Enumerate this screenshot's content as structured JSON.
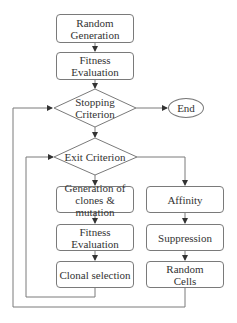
{
  "diagram": {
    "type": "flowchart",
    "nodes": {
      "random_generation": "Random Generation",
      "fitness_evaluation_1": "Fitness Evaluation",
      "stopping_criterion": "Stopping Criterion",
      "end": "End",
      "exit_criterion": "Exit Criterion",
      "generation_clones": "Generation of clones & mutation",
      "fitness_evaluation_2": "Fitness Evaluation",
      "clonal_selection": "Clonal selection",
      "affinity": "Affinity",
      "suppression": "Suppression",
      "random_cells": "Random Cells"
    },
    "edges": [
      [
        "random_generation",
        "fitness_evaluation_1"
      ],
      [
        "fitness_evaluation_1",
        "stopping_criterion"
      ],
      [
        "stopping_criterion",
        "end"
      ],
      [
        "stopping_criterion",
        "exit_criterion"
      ],
      [
        "exit_criterion",
        "generation_clones"
      ],
      [
        "generation_clones",
        "fitness_evaluation_2"
      ],
      [
        "fitness_evaluation_2",
        "clonal_selection"
      ],
      [
        "clonal_selection",
        "exit_criterion"
      ],
      [
        "exit_criterion",
        "affinity"
      ],
      [
        "affinity",
        "suppression"
      ],
      [
        "suppression",
        "random_cells"
      ],
      [
        "random_cells",
        "stopping_criterion"
      ]
    ],
    "colors": {
      "stroke": "#7a7a7a",
      "text": "#333333",
      "background": "#ffffff"
    }
  }
}
